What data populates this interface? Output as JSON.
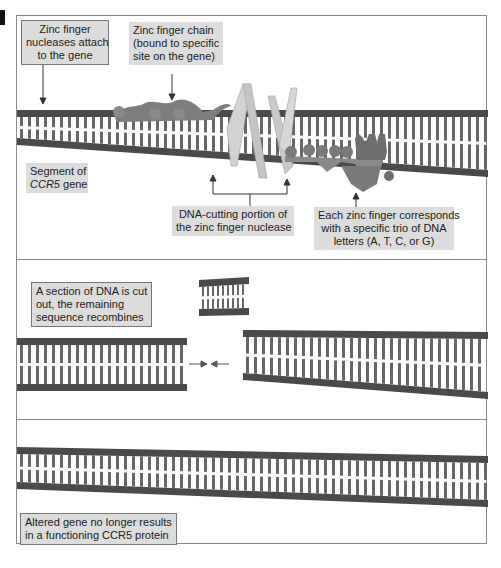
{
  "figure": {
    "type": "zinc-finger-nuclease-gene-editing",
    "colors": {
      "dna_backbone": "#4a4a4a",
      "dna_base": "#666666",
      "label_bg": "#dcdcdc",
      "protein": "#7a7a7a",
      "nuclease": "#cfcfcf"
    }
  },
  "panel_top": {
    "label_attach": [
      "Zinc finger",
      "nucleases attach",
      "to the gene"
    ],
    "label_chain": [
      "Zinc finger chain",
      "(bound to specific",
      "site on the gene)"
    ],
    "label_segment": {
      "line1": "Segment of",
      "line2_italic": "CCR5",
      "line2_rest": " gene"
    },
    "label_cutting": [
      "DNA-cutting portion of",
      "the zinc finger nuclease"
    ],
    "label_trio": [
      "Each zinc finger corresponds",
      "with a specific trio of DNA",
      "letters (A, T, C, or G)"
    ]
  },
  "panel_mid": {
    "label_cut": [
      "A section of DNA is cut",
      "out, the remaining",
      "sequence recombines"
    ]
  },
  "panel_bot": {
    "label_altered": [
      "Altered gene no longer results",
      "in a functioning CCR5 protein"
    ]
  }
}
